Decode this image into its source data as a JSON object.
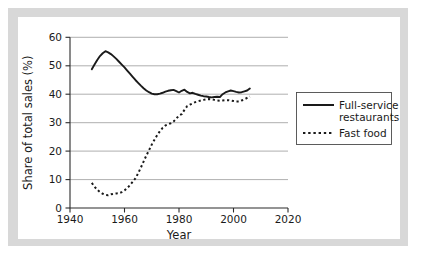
{
  "chart_data": {
    "type": "line",
    "title": "",
    "xlabel": "Year",
    "ylabel": "Share of total sales (%)",
    "xlim": [
      1940,
      2020
    ],
    "ylim": [
      0,
      60
    ],
    "xticks": [
      "1940",
      "1960",
      "1980",
      "2000",
      "2020"
    ],
    "yticks": [
      "0",
      "10",
      "20",
      "30",
      "40",
      "50",
      "60"
    ],
    "grid": "horizontal",
    "legend_position": "right",
    "series": [
      {
        "name": "Full-service restaurants",
        "style": "solid",
        "color": "#1a1a1a",
        "x": [
          1948,
          1949,
          1950,
          1951,
          1952,
          1953,
          1954,
          1955,
          1956,
          1957,
          1958,
          1959,
          1960,
          1961,
          1962,
          1963,
          1964,
          1965,
          1966,
          1967,
          1968,
          1969,
          1970,
          1971,
          1972,
          1973,
          1974,
          1975,
          1976,
          1977,
          1978,
          1979,
          1980,
          1981,
          1982,
          1983,
          1984,
          1985,
          1986,
          1987,
          1988,
          1989,
          1990,
          1991,
          1992,
          1993,
          1994,
          1995,
          1996,
          1997,
          1998,
          1999,
          2000,
          2001,
          2002,
          2003,
          2004,
          2005,
          2006
        ],
        "values": [
          48.8,
          50.4,
          52.0,
          53.4,
          54.4,
          55.1,
          54.7,
          54.1,
          53.3,
          52.4,
          51.4,
          50.4,
          49.4,
          48.3,
          47.2,
          46.1,
          45.0,
          44.0,
          43.0,
          42.1,
          41.3,
          40.7,
          40.2,
          40.0,
          40.0,
          40.2,
          40.5,
          40.9,
          41.2,
          41.4,
          41.5,
          41.1,
          40.6,
          41.2,
          41.6,
          40.8,
          40.3,
          40.5,
          40.1,
          39.8,
          39.5,
          39.3,
          39.2,
          39.0,
          38.9,
          39.0,
          39.1,
          39.0,
          40.0,
          40.6,
          41.0,
          41.3,
          41.1,
          40.8,
          40.6,
          40.7,
          41.0,
          41.3,
          42.0
        ]
      },
      {
        "name": "Fast food",
        "style": "dotted",
        "color": "#1a1a1a",
        "x": [
          1948,
          1949,
          1950,
          1951,
          1952,
          1953,
          1954,
          1955,
          1956,
          1957,
          1958,
          1959,
          1960,
          1961,
          1962,
          1963,
          1964,
          1965,
          1966,
          1967,
          1968,
          1969,
          1970,
          1971,
          1972,
          1973,
          1974,
          1975,
          1976,
          1977,
          1978,
          1979,
          1980,
          1981,
          1982,
          1983,
          1984,
          1985,
          1986,
          1987,
          1988,
          1989,
          1990,
          1991,
          1992,
          1993,
          1994,
          1995,
          1996,
          1997,
          1998,
          1999,
          2000,
          2001,
          2002,
          2003,
          2004,
          2005,
          2006
        ],
        "values": [
          8.8,
          7.5,
          6.4,
          5.6,
          5.0,
          4.6,
          4.5,
          4.8,
          5.0,
          5.1,
          5.2,
          5.6,
          6.2,
          7.0,
          8.0,
          9.2,
          10.4,
          12.2,
          14.2,
          16.3,
          18.4,
          20.3,
          22.3,
          24.0,
          25.6,
          27.0,
          28.2,
          29.0,
          29.4,
          29.8,
          30.4,
          31.4,
          32.5,
          33.0,
          34.5,
          35.8,
          36.3,
          36.8,
          37.2,
          37.5,
          37.8,
          38.0,
          38.2,
          38.3,
          38.2,
          38.0,
          37.8,
          37.7,
          37.8,
          37.9,
          37.9,
          37.8,
          37.6,
          37.4,
          37.4,
          37.8,
          38.2,
          38.7,
          39.2
        ]
      }
    ]
  },
  "legend": {
    "entries": [
      {
        "label_line1": "Full-service",
        "label_line2": "restaurants",
        "style": "solid"
      },
      {
        "label_line1": "Fast food",
        "label_line2": "",
        "style": "dotted"
      }
    ]
  },
  "axes": {
    "x_label": "Year",
    "y_label": "Share of total sales (%)",
    "x_tick_0": "1940",
    "x_tick_1": "1960",
    "x_tick_2": "1980",
    "x_tick_3": "2000",
    "x_tick_4": "2020",
    "y_tick_0": "0",
    "y_tick_1": "10",
    "y_tick_2": "20",
    "y_tick_3": "30",
    "y_tick_4": "40",
    "y_tick_5": "50",
    "y_tick_6": "60"
  },
  "colors": {
    "frame": "#d8d8d8",
    "background": "#ffffff",
    "ink": "#1a1a1a",
    "gridline": "#9a9a9a"
  }
}
